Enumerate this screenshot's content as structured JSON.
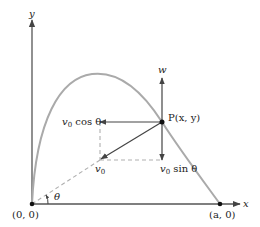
{
  "diagram": {
    "type": "projectile-trajectory",
    "colors": {
      "axis": "#555555",
      "curve": "#aaaaaa",
      "vector": "#444444",
      "dashed": "#b0b0b0",
      "point": "#111111",
      "text": "#222222"
    },
    "axes": {
      "x_label": "x",
      "y_label": "y"
    },
    "points": {
      "origin": {
        "label": "(0, 0)"
      },
      "end": {
        "label": "(a, 0)"
      },
      "p": {
        "label": "P(x, y)"
      }
    },
    "vectors": {
      "w": {
        "label": "w"
      },
      "horizontal": {
        "label_v": "v",
        "label_sub": "0",
        "label_rest": " cos θ"
      },
      "initial": {
        "label_v": "v",
        "label_sub": "0"
      },
      "vertical": {
        "label_v": "v",
        "label_sub": "0",
        "label_rest": " sin θ"
      }
    },
    "angle": {
      "label": "θ"
    }
  }
}
